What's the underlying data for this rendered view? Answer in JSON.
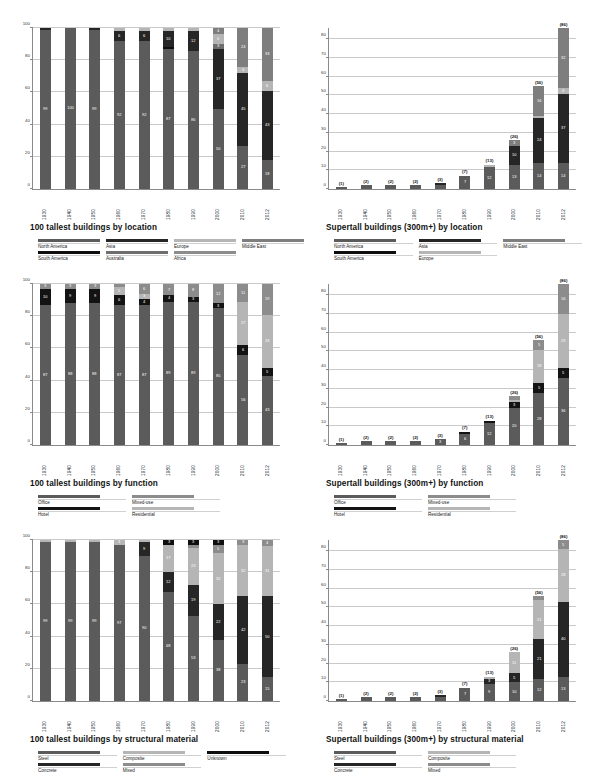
{
  "colors": {
    "north_america": "#5b5b5b",
    "south_america": "#0e0e0e",
    "asia": "#262626",
    "australia": "#6e6e6e",
    "europe": "#b5b5b5",
    "africa": "#8c8c8c",
    "middle_east": "#7e7e7e",
    "office": "#5b5b5b",
    "hotel": "#131313",
    "mixed_use": "#8c8c8c",
    "residential": "#b5b5b5",
    "steel": "#5b5b5b",
    "concrete": "#262626",
    "composite": "#b5b5b5",
    "mixed": "#8c8c8c",
    "unknown": "#0e0e0e",
    "gridline": "#c9c9c9",
    "axis": "#8a8a8a"
  },
  "charts": [
    {
      "id": "tallest-by-location",
      "title": "100 tallest buildings by location",
      "legend_layout": "loc",
      "chart_data": {
        "type": "bar",
        "stacked": true,
        "title": "100 tallest buildings by location",
        "xlabel": "",
        "ylabel": "",
        "ylim": [
          0,
          100
        ],
        "yticks": [
          0,
          20,
          40,
          60,
          80,
          100
        ],
        "grid": true,
        "legend_position": "below",
        "categories": [
          "1930",
          "1940",
          "1950",
          "1960",
          "1970",
          "1980",
          "1990",
          "2000",
          "2010",
          "2012"
        ],
        "series": [
          {
            "name": "North America",
            "color": "#5b5b5b",
            "values": [
              99,
              100,
              99,
              92,
              92,
              87,
              86,
              50,
              27,
              18
            ]
          },
          {
            "name": "South America",
            "color": "#0e0e0e",
            "values": [
              0,
              0,
              0,
              0,
              0,
              1,
              0,
              0,
              0,
              0
            ]
          },
          {
            "name": "Asia",
            "color": "#262626",
            "values": [
              1,
              0,
              1,
              6,
              6,
              10,
              12,
              37,
              45,
              43
            ]
          },
          {
            "name": "Australia",
            "color": "#6e6e6e",
            "values": [
              0,
              0,
              0,
              0,
              0,
              0,
              0,
              3,
              0,
              0
            ]
          },
          {
            "name": "Europe",
            "color": "#b5b5b5",
            "values": [
              0,
              0,
              0,
              2,
              2,
              2,
              2,
              6,
              4,
              6
            ]
          },
          {
            "name": "Africa",
            "color": "#8c8c8c",
            "values": [
              0,
              0,
              0,
              0,
              0,
              0,
              0,
              0,
              0,
              0
            ]
          },
          {
            "name": "Middle East",
            "color": "#7e7e7e",
            "values": [
              0,
              0,
              0,
              0,
              0,
              0,
              0,
              4,
              24,
              33
            ]
          }
        ]
      },
      "legend": [
        {
          "label": "North America",
          "color": "#5b5b5b"
        },
        {
          "label": "Asia",
          "color": "#262626"
        },
        {
          "label": "Europe",
          "color": "#b5b5b5"
        },
        {
          "label": "Middle East",
          "color": "#7e7e7e"
        },
        {
          "label": "South America",
          "color": "#0e0e0e"
        },
        {
          "label": "Australia",
          "color": "#6e6e6e"
        },
        {
          "label": "Africa",
          "color": "#8c8c8c"
        },
        {
          "label": "",
          "color": "transparent"
        }
      ]
    },
    {
      "id": "supertall-by-location",
      "title": "Supertall buildings (300m+) by location",
      "legend_layout": "loc4",
      "chart_data": {
        "type": "bar",
        "stacked": true,
        "title": "Supertall buildings (300m+) by location",
        "xlabel": "",
        "ylabel": "",
        "ylim": [
          0,
          86
        ],
        "yticks": [
          0,
          10,
          20,
          30,
          40,
          50,
          60,
          70,
          80
        ],
        "grid": true,
        "legend_position": "below",
        "categories": [
          "1930",
          "1940",
          "1950",
          "1960",
          "1970",
          "1980",
          "1990",
          "2000",
          "2010",
          "2012"
        ],
        "totals": [
          1,
          2,
          2,
          2,
          3,
          7,
          13,
          26,
          56,
          86
        ],
        "series": [
          {
            "name": "North America",
            "color": "#5b5b5b",
            "values": [
              1,
              2,
              2,
              2,
              2,
              7,
              12,
              13,
              14,
              14
            ]
          },
          {
            "name": "South America",
            "color": "#0e0e0e",
            "values": [
              0,
              0,
              0,
              0,
              0,
              0,
              0,
              0,
              0,
              0
            ]
          },
          {
            "name": "Asia",
            "color": "#262626",
            "values": [
              0,
              0,
              0,
              0,
              1,
              0,
              0,
              10,
              24,
              37
            ]
          },
          {
            "name": "Europe",
            "color": "#b5b5b5",
            "values": [
              0,
              0,
              0,
              0,
              0,
              0,
              1,
              0,
              1,
              3
            ]
          },
          {
            "name": "Middle East",
            "color": "#7e7e7e",
            "values": [
              0,
              0,
              0,
              0,
              0,
              0,
              0,
              3,
              16,
              32
            ]
          }
        ]
      },
      "legend": [
        {
          "label": "North America",
          "color": "#5b5b5b"
        },
        {
          "label": "Asia",
          "color": "#262626"
        },
        {
          "label": "Middle East",
          "color": "#7e7e7e"
        },
        {
          "label": "South America",
          "color": "#0e0e0e"
        },
        {
          "label": "Europe",
          "color": "#b5b5b5"
        },
        {
          "label": "",
          "color": "transparent"
        }
      ]
    },
    {
      "id": "tallest-by-function",
      "title": "100 tallest buildings by function",
      "legend_layout": "fn",
      "chart_data": {
        "type": "bar",
        "stacked": true,
        "title": "100 tallest buildings by function",
        "xlabel": "",
        "ylabel": "",
        "ylim": [
          0,
          100
        ],
        "yticks": [
          0,
          20,
          40,
          60,
          80,
          100
        ],
        "grid": true,
        "legend_position": "below",
        "categories": [
          "1930",
          "1940",
          "1950",
          "1960",
          "1970",
          "1980",
          "1990",
          "2000",
          "2010",
          "2012"
        ],
        "series": [
          {
            "name": "Office",
            "color": "#5b5b5b",
            "values": [
              87,
              88,
              88,
              87,
              87,
              89,
              89,
              85,
              56,
              43
            ]
          },
          {
            "name": "Hotel",
            "color": "#131313",
            "values": [
              10,
              9,
              9,
              6,
              4,
              4,
              3,
              3,
              6,
              5
            ]
          },
          {
            "name": "Residential",
            "color": "#b5b5b5",
            "values": [
              0,
              0,
              0,
              5,
              3,
              0,
              0,
              0,
              27,
              33
            ]
          },
          {
            "name": "Mixed-use",
            "color": "#8c8c8c",
            "values": [
              3,
              3,
              3,
              2,
              6,
              7,
              8,
              12,
              11,
              19
            ]
          }
        ]
      },
      "legend": [
        {
          "label": "Office",
          "color": "#5b5b5b"
        },
        {
          "label": "Mixed-use",
          "color": "#8c8c8c"
        },
        {
          "label": "Hotel",
          "color": "#131313"
        },
        {
          "label": "Residential",
          "color": "#b5b5b5"
        }
      ]
    },
    {
      "id": "supertall-by-function",
      "title": "Supertall buildings (300m+) by function",
      "legend_layout": "fn",
      "chart_data": {
        "type": "bar",
        "stacked": true,
        "title": "Supertall buildings (300m+) by function",
        "xlabel": "",
        "ylabel": "",
        "ylim": [
          0,
          86
        ],
        "yticks": [
          0,
          10,
          20,
          30,
          40,
          50,
          60,
          70,
          80
        ],
        "grid": true,
        "legend_position": "below",
        "categories": [
          "1930",
          "1940",
          "1950",
          "1960",
          "1970",
          "1980",
          "1990",
          "2000",
          "2010",
          "2012"
        ],
        "totals": [
          1,
          2,
          2,
          2,
          3,
          7,
          13,
          26,
          56,
          86
        ],
        "series": [
          {
            "name": "Office",
            "color": "#5b5b5b",
            "values": [
              1,
              2,
              2,
              2,
              3,
              6,
              12,
              20,
              28,
              36
            ]
          },
          {
            "name": "Hotel",
            "color": "#131313",
            "values": [
              0,
              0,
              0,
              0,
              0,
              1,
              1,
              3,
              5,
              5
            ]
          },
          {
            "name": "Residential",
            "color": "#b5b5b5",
            "values": [
              0,
              0,
              0,
              0,
              0,
              0,
              0,
              1,
              18,
              29
            ]
          },
          {
            "name": "Mixed-use",
            "color": "#8c8c8c",
            "values": [
              0,
              0,
              0,
              0,
              0,
              0,
              0,
              2,
              5,
              16
            ]
          }
        ]
      },
      "legend": [
        {
          "label": "Office",
          "color": "#5b5b5b"
        },
        {
          "label": "Mixed-use",
          "color": "#8c8c8c"
        },
        {
          "label": "Hotel",
          "color": "#131313"
        },
        {
          "label": "Residential",
          "color": "#b5b5b5"
        }
      ]
    },
    {
      "id": "tallest-by-structural-material",
      "title": "100 tallest buildings by structural material",
      "legend_layout": "mat",
      "chart_data": {
        "type": "bar",
        "stacked": true,
        "title": "100 tallest buildings by structural material",
        "xlabel": "",
        "ylabel": "",
        "ylim": [
          0,
          100
        ],
        "yticks": [
          0,
          20,
          40,
          60,
          80,
          100
        ],
        "grid": true,
        "legend_position": "below",
        "categories": [
          "1930",
          "1940",
          "1950",
          "1960",
          "1970",
          "1980",
          "1990",
          "2000",
          "2010",
          "2012"
        ],
        "series": [
          {
            "name": "Steel",
            "color": "#5b5b5b",
            "values": [
              99,
              99,
              99,
              97,
              90,
              68,
              53,
              38,
              23,
              15
            ]
          },
          {
            "name": "Concrete",
            "color": "#262626",
            "values": [
              0,
              0,
              0,
              0,
              9,
              12,
              19,
              22,
              42,
              50
            ]
          },
          {
            "name": "Composite",
            "color": "#b5b5b5",
            "values": [
              1,
              1,
              1,
              3,
              1,
              17,
              23,
              32,
              32,
              31
            ]
          },
          {
            "name": "Mixed",
            "color": "#8c8c8c",
            "values": [
              0,
              0,
              0,
              0,
              0,
              0,
              2,
              5,
              3,
              4
            ]
          },
          {
            "name": "Unknown",
            "color": "#0e0e0e",
            "values": [
              0,
              0,
              0,
              0,
              0,
              3,
              3,
              3,
              0,
              0
            ]
          }
        ]
      },
      "legend": [
        {
          "label": "Steel",
          "color": "#5b5b5b"
        },
        {
          "label": "Composite",
          "color": "#b5b5b5"
        },
        {
          "label": "Unknown",
          "color": "#0e0e0e"
        },
        {
          "label": "Concrete",
          "color": "#262626"
        },
        {
          "label": "Mixed",
          "color": "#8c8c8c"
        },
        {
          "label": "",
          "color": "transparent"
        }
      ]
    },
    {
      "id": "supertall-by-structural-material",
      "title": "Supertall buildings (300m+) by structural material",
      "legend_layout": "mat2",
      "chart_data": {
        "type": "bar",
        "stacked": true,
        "title": "Supertall buildings (300m+) by structural material",
        "xlabel": "",
        "ylabel": "",
        "ylim": [
          0,
          86
        ],
        "yticks": [
          0,
          10,
          20,
          30,
          40,
          50,
          60,
          70,
          80
        ],
        "grid": true,
        "legend_position": "below",
        "categories": [
          "1930",
          "1940",
          "1950",
          "1960",
          "1970",
          "1980",
          "1990",
          "2000",
          "2010",
          "2012"
        ],
        "totals": [
          1,
          2,
          2,
          2,
          3,
          7,
          13,
          26,
          56,
          86
        ],
        "series": [
          {
            "name": "Steel",
            "color": "#5b5b5b",
            "values": [
              1,
              2,
              2,
              2,
              2,
              7,
              9,
              10,
              12,
              13
            ]
          },
          {
            "name": "Concrete",
            "color": "#262626",
            "values": [
              0,
              0,
              0,
              0,
              1,
              0,
              3,
              5,
              21,
              40
            ]
          },
          {
            "name": "Composite",
            "color": "#b5b5b5",
            "values": [
              0,
              0,
              0,
              0,
              0,
              0,
              1,
              11,
              21,
              28
            ]
          },
          {
            "name": "Mixed",
            "color": "#8c8c8c",
            "values": [
              0,
              0,
              0,
              0,
              0,
              0,
              0,
              0,
              2,
              5
            ]
          }
        ]
      },
      "legend": [
        {
          "label": "Steel",
          "color": "#5b5b5b"
        },
        {
          "label": "Composite",
          "color": "#b5b5b5"
        },
        {
          "label": "Concrete",
          "color": "#262626"
        },
        {
          "label": "Mixed",
          "color": "#8c8c8c"
        }
      ]
    }
  ]
}
